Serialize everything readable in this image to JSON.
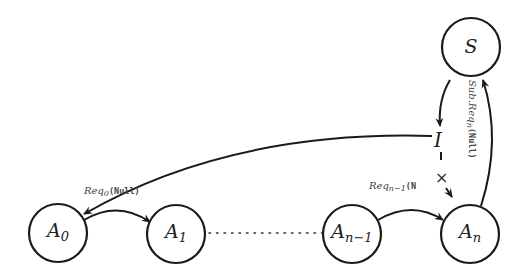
{
  "diagram": {
    "type": "state-transition",
    "nodes": [
      {
        "id": "A0",
        "label": "A",
        "sub": "0",
        "cx": 58,
        "cy": 233
      },
      {
        "id": "A1",
        "label": "A",
        "sub": "1",
        "cx": 176,
        "cy": 234
      },
      {
        "id": "An-1",
        "label": "A",
        "sub": "n−1",
        "cx": 352,
        "cy": 234
      },
      {
        "id": "An",
        "label": "A",
        "sub": "n",
        "cx": 470,
        "cy": 234
      },
      {
        "id": "S",
        "label": "S",
        "sub": "",
        "cx": 471,
        "cy": 47
      }
    ],
    "intermediate": {
      "label": "I"
    },
    "cross_mark": "×",
    "edges": [
      {
        "from": "A0",
        "to": "A1",
        "label_main": "Req",
        "label_sub": "0",
        "label_arg": "(Null)"
      },
      {
        "from": "A1",
        "to": "An-1",
        "style": "dotted"
      },
      {
        "from": "An-1",
        "to": "An",
        "label_main": "Req",
        "label_sub": "n−1",
        "label_arg": "(N"
      },
      {
        "from": "An",
        "to": "S",
        "label_main": "Sub.Req",
        "label_sub": "n",
        "label_arg": "(Null)"
      },
      {
        "from": "S",
        "to": "I"
      },
      {
        "from": "I",
        "to": "A0"
      },
      {
        "from": "I",
        "to": "An",
        "style": "blocked"
      }
    ],
    "colors": {
      "stroke": "#1a1a1a",
      "background": "#ffffff"
    }
  }
}
